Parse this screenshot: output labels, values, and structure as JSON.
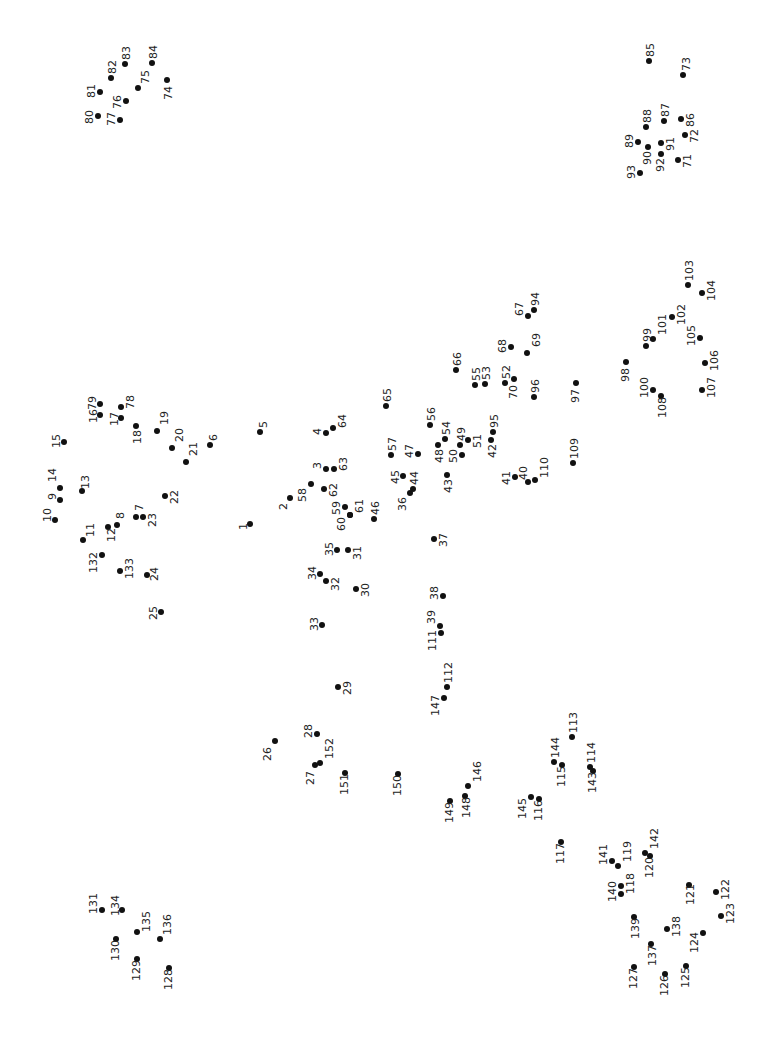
{
  "puzzle": {
    "type": "connect-the-dots",
    "label_orientation": "rotated -90deg",
    "dot_color": "#111111",
    "background": "#ffffff",
    "points": [
      {
        "n": "1",
        "x": 250,
        "y": 524,
        "lx": -12,
        "ly": 6
      },
      {
        "n": "2",
        "x": 290,
        "y": 498,
        "lx": -12,
        "ly": 12
      },
      {
        "n": "3",
        "x": 326,
        "y": 469,
        "lx": -14,
        "ly": 0
      },
      {
        "n": "4",
        "x": 326,
        "y": 433,
        "lx": -14,
        "ly": 2
      },
      {
        "n": "5",
        "x": 260,
        "y": 432,
        "lx": -2,
        "ly": -4
      },
      {
        "n": "6",
        "x": 210,
        "y": 445,
        "lx": -2,
        "ly": -4
      },
      {
        "n": "7",
        "x": 136,
        "y": 517,
        "lx": -2,
        "ly": -6
      },
      {
        "n": "8",
        "x": 117,
        "y": 525,
        "lx": -2,
        "ly": -6
      },
      {
        "n": "9",
        "x": 60,
        "y": 500,
        "lx": -13,
        "ly": 0
      },
      {
        "n": "10",
        "x": 55,
        "y": 520,
        "lx": -13,
        "ly": 2
      },
      {
        "n": "11",
        "x": 83,
        "y": 540,
        "lx": 2,
        "ly": -3
      },
      {
        "n": "12",
        "x": 108,
        "y": 527,
        "lx": -2,
        "ly": 15
      },
      {
        "n": "13",
        "x": 82,
        "y": 491,
        "lx": -2,
        "ly": -2
      },
      {
        "n": "14",
        "x": 60,
        "y": 488,
        "lx": -13,
        "ly": -6
      },
      {
        "n": "15",
        "x": 64,
        "y": 442,
        "lx": -13,
        "ly": 6
      },
      {
        "n": "16",
        "x": 100,
        "y": 415,
        "lx": -12,
        "ly": 8
      },
      {
        "n": "17",
        "x": 121,
        "y": 418,
        "lx": -12,
        "ly": 8
      },
      {
        "n": "18",
        "x": 136,
        "y": 426,
        "lx": -4,
        "ly": 18
      },
      {
        "n": "19",
        "x": 157,
        "y": 431,
        "lx": 2,
        "ly": -6
      },
      {
        "n": "20",
        "x": 172,
        "y": 448,
        "lx": 2,
        "ly": -6
      },
      {
        "n": "21",
        "x": 186,
        "y": 462,
        "lx": 2,
        "ly": -6
      },
      {
        "n": "22",
        "x": 165,
        "y": 496,
        "lx": 4,
        "ly": 8
      },
      {
        "n": "23",
        "x": 143,
        "y": 517,
        "lx": 4,
        "ly": 10
      },
      {
        "n": "24",
        "x": 147,
        "y": 575,
        "lx": 2,
        "ly": 6
      },
      {
        "n": "25",
        "x": 161,
        "y": 612,
        "lx": -13,
        "ly": 8
      },
      {
        "n": "26",
        "x": 275,
        "y": 741,
        "lx": -13,
        "ly": 20
      },
      {
        "n": "27",
        "x": 315,
        "y": 765,
        "lx": -10,
        "ly": 20
      },
      {
        "n": "28",
        "x": 317,
        "y": 734,
        "lx": -14,
        "ly": 4
      },
      {
        "n": "29",
        "x": 338,
        "y": 687,
        "lx": 4,
        "ly": 8
      },
      {
        "n": "30",
        "x": 356,
        "y": 589,
        "lx": 4,
        "ly": 8
      },
      {
        "n": "31",
        "x": 348,
        "y": 550,
        "lx": 4,
        "ly": 10
      },
      {
        "n": "32",
        "x": 326,
        "y": 581,
        "lx": 4,
        "ly": 10
      },
      {
        "n": "33",
        "x": 322,
        "y": 625,
        "lx": -13,
        "ly": 6
      },
      {
        "n": "34",
        "x": 320,
        "y": 574,
        "lx": -13,
        "ly": 6
      },
      {
        "n": "35",
        "x": 337,
        "y": 550,
        "lx": -13,
        "ly": 6
      },
      {
        "n": "36",
        "x": 410,
        "y": 493,
        "lx": -13,
        "ly": 18
      },
      {
        "n": "37",
        "x": 434,
        "y": 539,
        "lx": 4,
        "ly": 8
      },
      {
        "n": "38",
        "x": 443,
        "y": 596,
        "lx": -14,
        "ly": 4
      },
      {
        "n": "39",
        "x": 440,
        "y": 626,
        "lx": -14,
        "ly": -2
      },
      {
        "n": "40",
        "x": 528,
        "y": 482,
        "lx": -10,
        "ly": -2
      },
      {
        "n": "41",
        "x": 515,
        "y": 477,
        "lx": -14,
        "ly": 8
      },
      {
        "n": "42",
        "x": 491,
        "y": 440,
        "lx": -4,
        "ly": 18
      },
      {
        "n": "43",
        "x": 447,
        "y": 475,
        "lx": -4,
        "ly": 18
      },
      {
        "n": "44",
        "x": 413,
        "y": 489,
        "lx": -4,
        "ly": -4
      },
      {
        "n": "45",
        "x": 403,
        "y": 476,
        "lx": -13,
        "ly": 8
      },
      {
        "n": "46",
        "x": 374,
        "y": 519,
        "lx": -4,
        "ly": -4
      },
      {
        "n": "47",
        "x": 418,
        "y": 454,
        "lx": -14,
        "ly": 4
      },
      {
        "n": "48",
        "x": 438,
        "y": 445,
        "lx": -4,
        "ly": 18
      },
      {
        "n": "49",
        "x": 460,
        "y": 445,
        "lx": -4,
        "ly": -4
      },
      {
        "n": "50",
        "x": 462,
        "y": 455,
        "lx": -14,
        "ly": 8
      },
      {
        "n": "51",
        "x": 468,
        "y": 440,
        "lx": 4,
        "ly": 8
      },
      {
        "n": "52",
        "x": 505,
        "y": 383,
        "lx": -4,
        "ly": -4
      },
      {
        "n": "53",
        "x": 485,
        "y": 384,
        "lx": -4,
        "ly": -4
      },
      {
        "n": "54",
        "x": 445,
        "y": 439,
        "lx": -4,
        "ly": -4
      },
      {
        "n": "55",
        "x": 475,
        "y": 385,
        "lx": -4,
        "ly": -4
      },
      {
        "n": "56",
        "x": 430,
        "y": 425,
        "lx": -4,
        "ly": -4
      },
      {
        "n": "57",
        "x": 391,
        "y": 455,
        "lx": -4,
        "ly": -4
      },
      {
        "n": "58",
        "x": 311,
        "y": 484,
        "lx": -14,
        "ly": 18
      },
      {
        "n": "59",
        "x": 345,
        "y": 507,
        "lx": -14,
        "ly": 8
      },
      {
        "n": "60",
        "x": 350,
        "y": 515,
        "lx": -14,
        "ly": 16
      },
      {
        "n": "61",
        "x": 350,
        "y": 515,
        "lx": 4,
        "ly": -2
      },
      {
        "n": "62",
        "x": 324,
        "y": 489,
        "lx": 4,
        "ly": 8
      },
      {
        "n": "63",
        "x": 334,
        "y": 469,
        "lx": 4,
        "ly": 2
      },
      {
        "n": "64",
        "x": 333,
        "y": 428,
        "lx": 4,
        "ly": 0
      },
      {
        "n": "65",
        "x": 386,
        "y": 406,
        "lx": -4,
        "ly": -4
      },
      {
        "n": "66",
        "x": 456,
        "y": 370,
        "lx": -4,
        "ly": -4
      },
      {
        "n": "67",
        "x": 528,
        "y": 316,
        "lx": -14,
        "ly": 0
      },
      {
        "n": "68",
        "x": 511,
        "y": 347,
        "lx": -14,
        "ly": 6
      },
      {
        "n": "69",
        "x": 527,
        "y": 353,
        "lx": 4,
        "ly": -6
      },
      {
        "n": "70",
        "x": 514,
        "y": 379,
        "lx": -6,
        "ly": 20
      },
      {
        "n": "71",
        "x": 678,
        "y": 160,
        "lx": 4,
        "ly": 8
      },
      {
        "n": "72",
        "x": 685,
        "y": 135,
        "lx": 4,
        "ly": 8
      },
      {
        "n": "73",
        "x": 683,
        "y": 75,
        "lx": -2,
        "ly": -4
      },
      {
        "n": "74",
        "x": 167,
        "y": 80,
        "lx": -4,
        "ly": 20
      },
      {
        "n": "75",
        "x": 138,
        "y": 88,
        "lx": 2,
        "ly": -4
      },
      {
        "n": "76",
        "x": 126,
        "y": 101,
        "lx": -14,
        "ly": 8
      },
      {
        "n": "77",
        "x": 120,
        "y": 120,
        "lx": -14,
        "ly": 6
      },
      {
        "n": "78",
        "x": 121,
        "y": 407,
        "lx": 4,
        "ly": 2
      },
      {
        "n": "79",
        "x": 100,
        "y": 404,
        "lx": -13,
        "ly": 6
      },
      {
        "n": "80",
        "x": 98,
        "y": 116,
        "lx": -14,
        "ly": 8
      },
      {
        "n": "81",
        "x": 100,
        "y": 92,
        "lx": -14,
        "ly": 6
      },
      {
        "n": "82",
        "x": 111,
        "y": 78,
        "lx": -4,
        "ly": -4
      },
      {
        "n": "83",
        "x": 125,
        "y": 64,
        "lx": -4,
        "ly": -4
      },
      {
        "n": "84",
        "x": 152,
        "y": 63,
        "lx": -4,
        "ly": -4
      },
      {
        "n": "85",
        "x": 649,
        "y": 61,
        "lx": -4,
        "ly": -4
      },
      {
        "n": "86",
        "x": 681,
        "y": 119,
        "lx": 4,
        "ly": 8
      },
      {
        "n": "87",
        "x": 664,
        "y": 121,
        "lx": -4,
        "ly": -4
      },
      {
        "n": "88",
        "x": 646,
        "y": 127,
        "lx": -4,
        "ly": -4
      },
      {
        "n": "89",
        "x": 638,
        "y": 142,
        "lx": -14,
        "ly": 6
      },
      {
        "n": "90",
        "x": 648,
        "y": 147,
        "lx": -6,
        "ly": 18
      },
      {
        "n": "91",
        "x": 661,
        "y": 143,
        "lx": 4,
        "ly": 8
      },
      {
        "n": "92",
        "x": 661,
        "y": 154,
        "lx": -6,
        "ly": 18
      },
      {
        "n": "93",
        "x": 640,
        "y": 173,
        "lx": -14,
        "ly": 6
      },
      {
        "n": "94",
        "x": 534,
        "y": 310,
        "lx": -4,
        "ly": -4
      },
      {
        "n": "95",
        "x": 493,
        "y": 432,
        "lx": -4,
        "ly": -4
      },
      {
        "n": "96",
        "x": 534,
        "y": 397,
        "lx": -4,
        "ly": -4
      },
      {
        "n": "97",
        "x": 576,
        "y": 383,
        "lx": -6,
        "ly": 20
      },
      {
        "n": "98",
        "x": 626,
        "y": 362,
        "lx": -6,
        "ly": 20
      },
      {
        "n": "99",
        "x": 646,
        "y": 346,
        "lx": -4,
        "ly": -4
      },
      {
        "n": "100",
        "x": 653,
        "y": 390,
        "lx": -14,
        "ly": 8
      },
      {
        "n": "101",
        "x": 653,
        "y": 339,
        "lx": 4,
        "ly": -4
      },
      {
        "n": "102",
        "x": 672,
        "y": 317,
        "lx": 4,
        "ly": 8
      },
      {
        "n": "103",
        "x": 688,
        "y": 285,
        "lx": -4,
        "ly": -4
      },
      {
        "n": "104",
        "x": 702,
        "y": 293,
        "lx": 4,
        "ly": 8
      },
      {
        "n": "105",
        "x": 700,
        "y": 338,
        "lx": -14,
        "ly": 8
      },
      {
        "n": "106",
        "x": 705,
        "y": 363,
        "lx": 4,
        "ly": 8
      },
      {
        "n": "107",
        "x": 702,
        "y": 390,
        "lx": 4,
        "ly": 8
      },
      {
        "n": "108",
        "x": 661,
        "y": 396,
        "lx": -4,
        "ly": 22
      },
      {
        "n": "109",
        "x": 573,
        "y": 463,
        "lx": -4,
        "ly": -4
      },
      {
        "n": "110",
        "x": 535,
        "y": 480,
        "lx": 4,
        "ly": -2
      },
      {
        "n": "111",
        "x": 441,
        "y": 633,
        "lx": -14,
        "ly": 18
      },
      {
        "n": "112",
        "x": 447,
        "y": 687,
        "lx": -4,
        "ly": -4
      },
      {
        "n": "113",
        "x": 572,
        "y": 737,
        "lx": -4,
        "ly": -4
      },
      {
        "n": "114",
        "x": 590,
        "y": 767,
        "lx": -4,
        "ly": -4
      },
      {
        "n": "115",
        "x": 562,
        "y": 765,
        "lx": -6,
        "ly": 22
      },
      {
        "n": "116",
        "x": 539,
        "y": 799,
        "lx": -6,
        "ly": 22
      },
      {
        "n": "117",
        "x": 561,
        "y": 842,
        "lx": -6,
        "ly": 22
      },
      {
        "n": "118",
        "x": 621,
        "y": 886,
        "lx": 4,
        "ly": 8
      },
      {
        "n": "119",
        "x": 618,
        "y": 866,
        "lx": 4,
        "ly": -4
      },
      {
        "n": "120",
        "x": 650,
        "y": 856,
        "lx": -6,
        "ly": 22
      },
      {
        "n": "121",
        "x": 689,
        "y": 885,
        "lx": -4,
        "ly": 20
      },
      {
        "n": "122",
        "x": 716,
        "y": 892,
        "lx": 4,
        "ly": 8
      },
      {
        "n": "123",
        "x": 721,
        "y": 916,
        "lx": 4,
        "ly": 8
      },
      {
        "n": "124",
        "x": 703,
        "y": 933,
        "lx": -14,
        "ly": 20
      },
      {
        "n": "125",
        "x": 686,
        "y": 966,
        "lx": -6,
        "ly": 22
      },
      {
        "n": "126",
        "x": 665,
        "y": 974,
        "lx": -6,
        "ly": 22
      },
      {
        "n": "127",
        "x": 634,
        "y": 967,
        "lx": -6,
        "ly": 22
      },
      {
        "n": "128",
        "x": 169,
        "y": 968,
        "lx": -6,
        "ly": 22
      },
      {
        "n": "129",
        "x": 137,
        "y": 959,
        "lx": -6,
        "ly": 22
      },
      {
        "n": "130",
        "x": 116,
        "y": 939,
        "lx": -6,
        "ly": 22
      },
      {
        "n": "131",
        "x": 102,
        "y": 910,
        "lx": -14,
        "ly": 4
      },
      {
        "n": "132",
        "x": 102,
        "y": 555,
        "lx": -14,
        "ly": 18
      },
      {
        "n": "133",
        "x": 120,
        "y": 571,
        "lx": 4,
        "ly": 8
      },
      {
        "n": "134",
        "x": 122,
        "y": 910,
        "lx": -12,
        "ly": 6
      },
      {
        "n": "135",
        "x": 137,
        "y": 932,
        "lx": 4,
        "ly": 0
      },
      {
        "n": "136",
        "x": 160,
        "y": 939,
        "lx": 2,
        "ly": -4
      },
      {
        "n": "137",
        "x": 651,
        "y": 944,
        "lx": -4,
        "ly": 22
      },
      {
        "n": "138",
        "x": 667,
        "y": 929,
        "lx": 4,
        "ly": 8
      },
      {
        "n": "139",
        "x": 634,
        "y": 917,
        "lx": -4,
        "ly": 22
      },
      {
        "n": "140",
        "x": 621,
        "y": 894,
        "lx": -14,
        "ly": 8
      },
      {
        "n": "141",
        "x": 612,
        "y": 861,
        "lx": -14,
        "ly": 4
      },
      {
        "n": "142",
        "x": 645,
        "y": 853,
        "lx": 4,
        "ly": -4
      },
      {
        "n": "143",
        "x": 593,
        "y": 771,
        "lx": -6,
        "ly": 22
      },
      {
        "n": "144",
        "x": 554,
        "y": 762,
        "lx": -4,
        "ly": -4
      },
      {
        "n": "145",
        "x": 531,
        "y": 797,
        "lx": -14,
        "ly": 22
      },
      {
        "n": "146",
        "x": 468,
        "y": 786,
        "lx": 4,
        "ly": -4
      },
      {
        "n": "147",
        "x": 444,
        "y": 698,
        "lx": -14,
        "ly": 18
      },
      {
        "n": "148",
        "x": 465,
        "y": 796,
        "lx": -4,
        "ly": 22
      },
      {
        "n": "149",
        "x": 450,
        "y": 801,
        "lx": -6,
        "ly": 22
      },
      {
        "n": "150",
        "x": 398,
        "y": 774,
        "lx": -6,
        "ly": 22
      },
      {
        "n": "151",
        "x": 345,
        "y": 773,
        "lx": -6,
        "ly": 22
      },
      {
        "n": "152",
        "x": 320,
        "y": 763,
        "lx": 4,
        "ly": -4
      }
    ]
  }
}
